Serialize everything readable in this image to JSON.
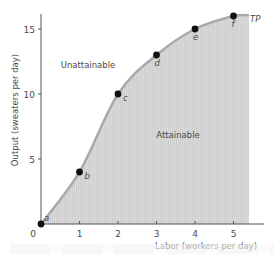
{
  "chart_data": {
    "type": "line",
    "title": "",
    "xlabel": "Labor (workers per day)",
    "ylabel": "Output (sweaters per day)",
    "x": [
      0,
      1,
      2,
      3,
      4,
      5
    ],
    "series": [
      {
        "name": "TP",
        "values": [
          0,
          4,
          10,
          13,
          15,
          16
        ],
        "point_labels": [
          "a",
          "b",
          "c",
          "d",
          "e",
          "f"
        ]
      }
    ],
    "xlim": [
      0,
      5.4
    ],
    "ylim": [
      0,
      16
    ],
    "xticks": [
      "0",
      "1",
      "2",
      "3",
      "4",
      "5"
    ],
    "yticks": [
      "5",
      "10",
      "15"
    ],
    "origin_label": "0",
    "regions": [
      {
        "label": "Unattainable",
        "position": "above curve"
      },
      {
        "label": "Attainable",
        "position": "below curve (shaded)"
      }
    ],
    "curve_label": "TP",
    "grid": false,
    "colors": {
      "curve": "#a9a9a9",
      "shade": "#d6d6d6",
      "point": "#111111",
      "axis": "#555555"
    }
  }
}
